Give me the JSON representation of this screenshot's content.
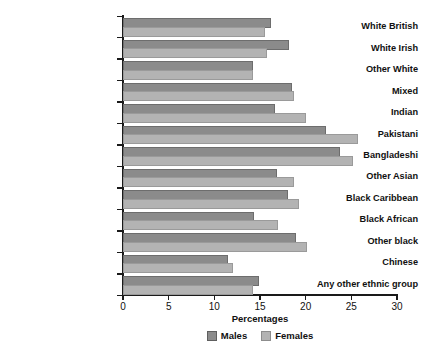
{
  "chart_data": {
    "type": "bar",
    "orientation": "horizontal",
    "title": "",
    "xlabel": "Percentages",
    "ylabel": "",
    "xlim": [
      0,
      30
    ],
    "xticks": [
      0,
      5,
      10,
      15,
      20,
      25,
      30
    ],
    "grid": false,
    "legend_position": "bottom-center",
    "categories": [
      "White British",
      "White Irish",
      "Other White",
      "Mixed",
      "Indian",
      "Pakistani",
      "Bangladeshi",
      "Other Asian",
      "Black Caribbean",
      "Black African",
      "Other black",
      "Chinese",
      "Any other ethnic group"
    ],
    "series": [
      {
        "name": "Males",
        "color": "#8b8b8b",
        "values": [
          16.0,
          18.0,
          14.0,
          18.3,
          16.4,
          22.0,
          23.5,
          16.6,
          17.9,
          14.1,
          18.7,
          11.3,
          14.7
        ]
      },
      {
        "name": "Females",
        "color": "#b3b3b3",
        "values": [
          15.3,
          15.5,
          14.0,
          18.5,
          19.8,
          25.5,
          25.0,
          18.5,
          19.0,
          16.8,
          19.9,
          11.8,
          14.0
        ]
      }
    ]
  }
}
